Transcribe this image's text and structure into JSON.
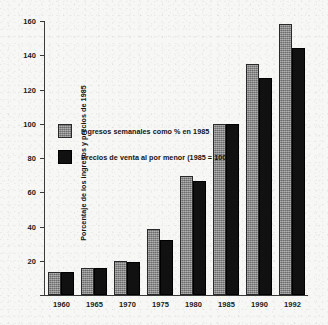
{
  "chart_data": {
    "type": "bar",
    "title": "",
    "subtitle": "",
    "xlabel": "",
    "ylabel": "Porcentaje de los ingresos y precios de 1985",
    "ylim": [
      0,
      160
    ],
    "yticks": [
      0,
      20,
      40,
      60,
      80,
      100,
      120,
      140,
      160
    ],
    "ytick_labels": [
      "",
      "20",
      "40",
      "60",
      "80",
      "100",
      "120",
      "140",
      "160"
    ],
    "grid": false,
    "legend_position": "inside-upper-left",
    "categories": [
      "1960",
      "1965",
      "1970",
      "1975",
      "1980",
      "1985",
      "1990",
      "1992"
    ],
    "series": [
      {
        "name": "Ingresos semanales como % en 1985",
        "color": "#8a8a8a",
        "values": [
          13.5,
          16,
          20,
          38.5,
          69.5,
          100,
          135,
          158
        ]
      },
      {
        "name": "Precios de venta al por menor (1985 = 100)",
        "color": "#111111",
        "values": [
          13.5,
          15.5,
          19,
          32,
          66.5,
          100,
          127,
          144
        ]
      }
    ],
    "annotations": []
  },
  "legend": {
    "items": [
      {
        "label": "Ingresos semanales como % en 1985",
        "swatch": "series-a"
      },
      {
        "label": "Precios de venta al por menor (1985 = 100)",
        "swatch": "series-b"
      }
    ]
  },
  "axes": {
    "y_title": "Porcentaje de los ingresos y precios de 1985"
  }
}
